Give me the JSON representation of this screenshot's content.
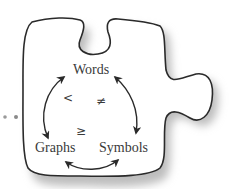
{
  "diagram": {
    "type": "puzzle-piece-concept-triangle",
    "nodes": [
      {
        "id": "words",
        "label": "Words"
      },
      {
        "id": "graphs",
        "label": "Graphs"
      },
      {
        "id": "symbols",
        "label": "Symbols"
      }
    ],
    "edges": [
      {
        "from": "words",
        "to": "graphs",
        "direction": "both"
      },
      {
        "from": "words",
        "to": "symbols",
        "direction": "both"
      },
      {
        "from": "graphs",
        "to": "symbols",
        "direction": "both"
      }
    ],
    "relations": [
      {
        "symbol": "<",
        "near": "words-graphs"
      },
      {
        "symbol": "≠",
        "near": "words-symbols"
      },
      {
        "symbol": "≥",
        "near": "graphs-symbols"
      }
    ],
    "decorations": {
      "dots": 2,
      "outline_color": "#2a2a2a",
      "shadow_color": "#b8b8b8",
      "text_color": "#3a3a3a"
    }
  }
}
